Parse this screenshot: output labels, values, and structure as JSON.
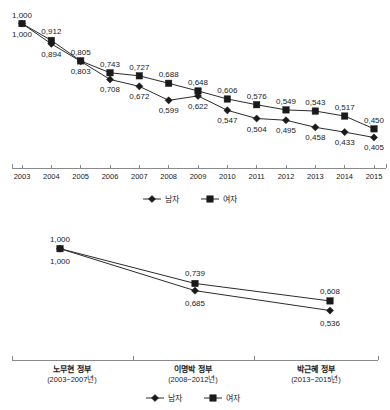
{
  "legend": {
    "male_label": "남자",
    "female_label": "여자",
    "male_marker": "diamond-marker-icon",
    "female_marker": "square-marker-icon"
  },
  "colors": {
    "line": "#2b2b2b",
    "marker": "#1a1a1a",
    "axis": "#8a8a8a",
    "text": "#1a1a1a",
    "background": "#ffffff"
  },
  "chart_data": [
    {
      "type": "line",
      "title": "",
      "xlabel": "",
      "ylabel": "",
      "grid": false,
      "legend_position": "bottom",
      "categories": [
        "2003",
        "2004",
        "2005",
        "2006",
        "2007",
        "2008",
        "2009",
        "2010",
        "2011",
        "2012",
        "2013",
        "2014",
        "2015"
      ],
      "ylim": [
        0.35,
        1.05
      ],
      "series": [
        {
          "name": "여자",
          "marker": "square",
          "values": [
            1.0,
            0.912,
            0.805,
            0.743,
            0.727,
            0.688,
            0.648,
            0.606,
            0.576,
            0.549,
            0.543,
            0.517,
            0.45
          ],
          "labels": [
            "1,000",
            "0,912",
            "0,805",
            "0,743",
            "0,727",
            "0,688",
            "0,648",
            "0,606",
            "0,576",
            "0,549",
            "0,543",
            "0,517",
            "0,450"
          ]
        },
        {
          "name": "남자",
          "marker": "diamond",
          "values": [
            1.0,
            0.894,
            0.803,
            0.708,
            0.672,
            0.599,
            0.622,
            0.547,
            0.504,
            0.495,
            0.458,
            0.433,
            0.405
          ],
          "labels": [
            "1,000",
            "0,894",
            "0,803",
            "0,708",
            "0,672",
            "0,599",
            "0,622",
            "0,547",
            "0,504",
            "0,495",
            "0,458",
            "0,433",
            "0,405"
          ]
        }
      ]
    },
    {
      "type": "line",
      "title": "",
      "xlabel": "",
      "ylabel": "",
      "grid": false,
      "legend_position": "bottom",
      "categories": [
        "노무현 정부",
        "이명박 정부",
        "박근혜 정부"
      ],
      "category_subs": [
        "(2003~2007년)",
        "(2008~2012년)",
        "(2013~2015년)"
      ],
      "ylim": [
        0.45,
        1.05
      ],
      "series": [
        {
          "name": "여자",
          "marker": "square",
          "values": [
            1.0,
            0.739,
            0.608
          ],
          "labels": [
            "1,000",
            "0,739",
            "0,608"
          ]
        },
        {
          "name": "남자",
          "marker": "diamond",
          "values": [
            1.0,
            0.685,
            0.536
          ],
          "labels": [
            "1,000",
            "0,685",
            "0,536"
          ]
        }
      ]
    }
  ]
}
